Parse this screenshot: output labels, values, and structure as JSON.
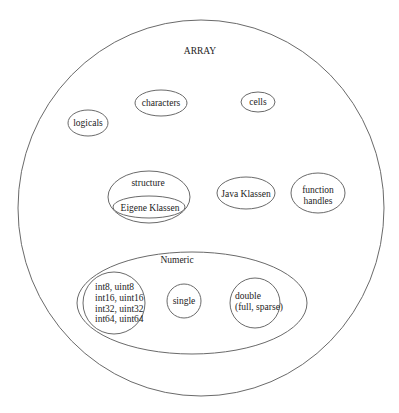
{
  "diagram": {
    "title": "ARRAY",
    "nodes": {
      "logicals": "logicals",
      "characters": "characters",
      "cells": "cells",
      "structure": "structure",
      "eigene_klassen": "Eigene Klassen",
      "java_klassen": "Java Klassen",
      "function_handles_line1": "function",
      "function_handles_line2": "handles",
      "numeric": "Numeric",
      "integers": [
        "int8, uint8",
        "int16, uint16",
        "int32, uint32",
        "int64, uint64"
      ],
      "single": "single",
      "double_line1": "double",
      "double_line2": "(full, sparse)"
    },
    "colors": {
      "stroke": "#6a6a6a",
      "text": "#222222",
      "background": "#ffffff"
    }
  }
}
